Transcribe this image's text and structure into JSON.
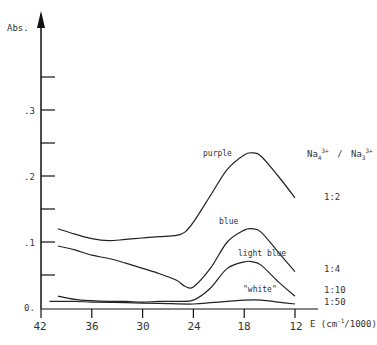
{
  "chart_data": {
    "type": "line",
    "title": "",
    "xlabel": "E (cm-1/1000)",
    "ylabel": "Abs.",
    "xlim": [
      42,
      12
    ],
    "ylim": [
      0,
      0.4
    ],
    "x_reversed": true,
    "grid": false,
    "x_ticks": [
      42,
      36,
      30,
      24,
      18,
      12
    ],
    "y_ticks": [
      0.0,
      0.05,
      0.1,
      0.15,
      0.2,
      0.25,
      0.3,
      0.35
    ],
    "y_tick_labels": [
      "0.",
      "",
      ".1",
      "",
      ".2",
      "",
      ".3",
      ""
    ],
    "legend_title": "Na4 3+ / Na3 3+",
    "legend_position": "right",
    "series": [
      {
        "name": "purple",
        "ratio": "1:2",
        "x": [
          40,
          38,
          36,
          34,
          32,
          30,
          28,
          26,
          25,
          24,
          22,
          20,
          18,
          17,
          16,
          14,
          12
        ],
        "values": [
          0.12,
          0.112,
          0.105,
          0.102,
          0.104,
          0.106,
          0.108,
          0.11,
          0.115,
          0.13,
          0.17,
          0.21,
          0.232,
          0.235,
          0.23,
          0.2,
          0.167
        ]
      },
      {
        "name": "blue",
        "ratio": "1:4",
        "x": [
          40,
          38,
          36,
          34,
          32,
          30,
          28,
          26,
          25,
          24,
          22,
          20,
          18,
          17,
          16,
          14,
          12
        ],
        "values": [
          0.094,
          0.088,
          0.08,
          0.075,
          0.068,
          0.06,
          0.052,
          0.042,
          0.033,
          0.032,
          0.06,
          0.1,
          0.118,
          0.12,
          0.115,
          0.085,
          0.055
        ]
      },
      {
        "name": "light blue",
        "ratio": "1:10",
        "x": [
          40,
          38,
          36,
          34,
          32,
          30,
          28,
          26,
          24,
          22,
          20,
          18,
          17,
          16,
          14,
          12
        ],
        "values": [
          0.018,
          0.013,
          0.011,
          0.01,
          0.01,
          0.009,
          0.01,
          0.01,
          0.012,
          0.03,
          0.06,
          0.07,
          0.07,
          0.065,
          0.04,
          0.018
        ]
      },
      {
        "name": "\"white\"",
        "ratio": "1:50",
        "x": [
          41,
          38,
          36,
          32,
          28,
          24,
          22,
          20,
          18,
          16,
          14,
          12
        ],
        "values": [
          0.01,
          0.01,
          0.009,
          0.008,
          0.007,
          0.006,
          0.008,
          0.01,
          0.012,
          0.012,
          0.009,
          0.006
        ]
      }
    ]
  },
  "labels": {
    "y_axis": "Abs.",
    "x_axis": "E (cm",
    "x_axis_sup": "-1",
    "x_axis_tail": "/1000)",
    "legend_na4": "Na",
    "legend_na4_sub": "4",
    "legend_na4_sup": "3+",
    "legend_sep": "/",
    "legend_na3": "Na",
    "legend_na3_sub": "3",
    "legend_na3_sup": "3+",
    "y_tick_0": "0.",
    "y_tick_1": ".1",
    "y_tick_2": ".2",
    "y_tick_3": ".3",
    "x_tick_0": "42",
    "x_tick_1": "36",
    "x_tick_2": "30",
    "x_tick_3": "24",
    "x_tick_4": "18",
    "x_tick_5": "12",
    "curve_purple": "purple",
    "curve_blue": "blue",
    "curve_light_blue": "light blue",
    "curve_white": "\"white\"",
    "ratio_1_2": "1:2",
    "ratio_1_4": "1:4",
    "ratio_1_10": "1:10",
    "ratio_1_50": "1:50"
  }
}
